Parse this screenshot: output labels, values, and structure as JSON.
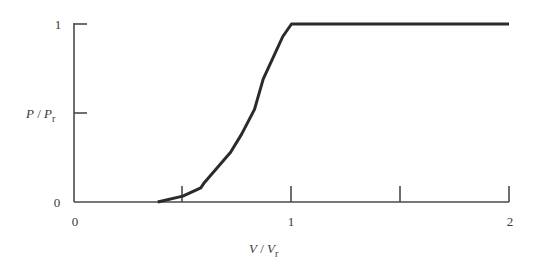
{
  "chart_data": {
    "type": "line",
    "title": "",
    "xlabel": "V / Vr",
    "ylabel": "P / Pr",
    "xlabel_main": "V",
    "xlabel_denom": "V",
    "xlabel_sub": "r",
    "ylabel_main": "P",
    "ylabel_denom": "P",
    "ylabel_sub": "r",
    "xlim": [
      0,
      2
    ],
    "ylim": [
      0,
      1
    ],
    "x_ticks": [
      0,
      0.5,
      1,
      1.5,
      2
    ],
    "x_tick_labels": [
      "0",
      "",
      "1",
      "",
      "2"
    ],
    "y_ticks": [
      0,
      0.5,
      1
    ],
    "y_tick_labels": [
      "0",
      "",
      "1"
    ],
    "grid": false,
    "legend": null,
    "series": [
      {
        "name": "Power curve",
        "color": "#2b2b2b",
        "x": [
          0,
          0.385,
          0.5,
          0.583,
          0.6,
          0.72,
          0.77,
          0.83,
          0.87,
          0.93,
          0.96,
          1.0,
          2.0
        ],
        "y": [
          0,
          0,
          0.033,
          0.08,
          0.11,
          0.28,
          0.38,
          0.52,
          0.69,
          0.85,
          0.93,
          1.0,
          1.0
        ]
      }
    ]
  },
  "labels": {
    "x_tick_0": "0",
    "x_tick_1": "1",
    "x_tick_2": "2",
    "y_tick_0": "0",
    "y_tick_1": "1",
    "x_title_main": "V",
    "x_title_slash": " / ",
    "x_title_denom": "V",
    "x_title_sub": "r",
    "y_title_main": "P",
    "y_title_slash": " / ",
    "y_title_denom": "P",
    "y_title_sub": "r"
  }
}
